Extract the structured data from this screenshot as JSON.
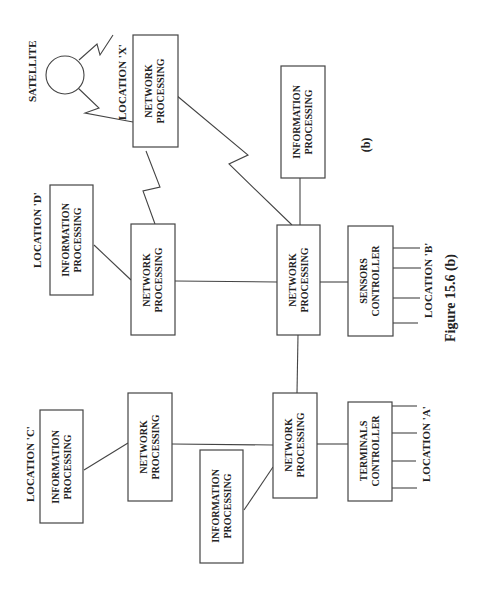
{
  "diagram": {
    "caption": "Figure 15.6 (b)",
    "sublabel": "(b)",
    "orientation": "rotated 90deg counter-clockwise (landscape on portrait page)",
    "satellite": {
      "label": "SATELLITE"
    },
    "locations": {
      "x": {
        "label": "LOCATION 'X'",
        "network": [
          "NETWORK",
          "PROCESSING"
        ]
      },
      "d": {
        "label": "LOCATION 'D'",
        "info": [
          "INFORMATION",
          "PROCESSING"
        ],
        "network": [
          "NETWORK",
          "PROCESSING"
        ]
      },
      "b": {
        "label": "LOCATION 'B'",
        "network": [
          "NETWORK",
          "PROCESSING"
        ],
        "controller": [
          "SENSORS",
          "CONTROLLER"
        ],
        "info": [
          "INFORMATION",
          "PROCESSING"
        ]
      },
      "c": {
        "label": "LOCATION 'C'",
        "info": [
          "INFORMATION",
          "PROCESSING"
        ],
        "network": [
          "NETWORK",
          "PROCESSING"
        ]
      },
      "a": {
        "label": "LOCATION 'A'",
        "network": [
          "NETWORK",
          "PROCESSING"
        ],
        "controller": [
          "TERMINALS",
          "CONTROLLER"
        ],
        "info": [
          "INFORMATION",
          "PROCESSING"
        ]
      }
    },
    "links": [
      {
        "from": "satellite",
        "to": "network-x",
        "type": "radio"
      },
      {
        "from": "network-x",
        "to": "network-d",
        "type": "radio"
      },
      {
        "from": "network-x",
        "to": "network-b",
        "type": "radio"
      },
      {
        "from": "info-b",
        "to": "network-b",
        "type": "wire"
      },
      {
        "from": "info-d",
        "to": "network-d",
        "type": "wire"
      },
      {
        "from": "network-d",
        "to": "network-b",
        "type": "wire"
      },
      {
        "from": "network-b",
        "to": "sensors-controller",
        "type": "wire"
      },
      {
        "from": "network-b",
        "to": "network-a",
        "type": "wire"
      },
      {
        "from": "info-c",
        "to": "network-c",
        "type": "wire"
      },
      {
        "from": "network-c",
        "to": "network-a",
        "type": "wire"
      },
      {
        "from": "info-a",
        "to": "network-a",
        "type": "wire"
      },
      {
        "from": "network-a",
        "to": "terminals-controller",
        "type": "wire"
      }
    ]
  }
}
